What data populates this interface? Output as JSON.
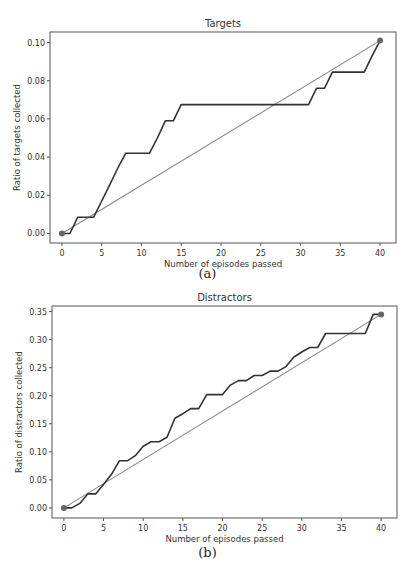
{
  "chart_data": [
    {
      "type": "line",
      "title": "Targets",
      "xlabel": "Number of episodes passed",
      "ylabel": "Ratio of targets collected",
      "caption": "(a)",
      "xlim": [
        -1.5,
        42
      ],
      "ylim": [
        -0.005,
        0.1055
      ],
      "xticks": [
        0,
        5,
        10,
        15,
        20,
        25,
        30,
        35,
        40
      ],
      "yticks": [
        0.0,
        0.02,
        0.04,
        0.06,
        0.08,
        0.1
      ],
      "ytick_labels": [
        "0.00",
        "0.02",
        "0.04",
        "0.06",
        "0.08",
        "0.10"
      ],
      "grid": false,
      "series": [
        {
          "name": "collected",
          "color": "#333333",
          "x": [
            0,
            1,
            2,
            3,
            4,
            5,
            6,
            7,
            8,
            9,
            10,
            11,
            12,
            13,
            14,
            15,
            16,
            17,
            18,
            19,
            20,
            21,
            22,
            23,
            24,
            25,
            26,
            27,
            28,
            29,
            30,
            31,
            32,
            33,
            34,
            35,
            36,
            37,
            38,
            39,
            40
          ],
          "values": [
            0,
            0,
            0.0085,
            0.0085,
            0.0085,
            0.017,
            0.0255,
            0.034,
            0.042,
            0.042,
            0.042,
            0.042,
            0.05,
            0.059,
            0.059,
            0.0675,
            0.0675,
            0.0675,
            0.0675,
            0.0675,
            0.0675,
            0.0675,
            0.0675,
            0.0675,
            0.0675,
            0.0675,
            0.0675,
            0.0675,
            0.0675,
            0.0675,
            0.0675,
            0.0675,
            0.076,
            0.076,
            0.0845,
            0.0845,
            0.0845,
            0.0845,
            0.0845,
            0.093,
            0.101
          ]
        },
        {
          "name": "linear reference",
          "color": "#888888",
          "x": [
            0,
            40
          ],
          "values": [
            0,
            0.101
          ]
        }
      ],
      "markers": [
        {
          "x": 0,
          "y": 0
        },
        {
          "x": 40,
          "y": 0.101
        }
      ]
    },
    {
      "type": "line",
      "title": "Distractors",
      "xlabel": "Number of episodes passed",
      "ylabel": "Ratio of distractors collected",
      "caption": "(b)",
      "xlim": [
        -1.5,
        42
      ],
      "ylim": [
        -0.018,
        0.36
      ],
      "xticks": [
        0,
        5,
        10,
        15,
        20,
        25,
        30,
        35,
        40
      ],
      "yticks": [
        0.0,
        0.05,
        0.1,
        0.15,
        0.2,
        0.25,
        0.3,
        0.35
      ],
      "ytick_labels": [
        "0.00",
        "0.05",
        "0.10",
        "0.15",
        "0.20",
        "0.25",
        "0.30",
        "0.35"
      ],
      "grid": false,
      "series": [
        {
          "name": "collected",
          "color": "#333333",
          "x": [
            0,
            1,
            2,
            3,
            4,
            5,
            6,
            7,
            8,
            9,
            10,
            11,
            12,
            13,
            14,
            15,
            16,
            17,
            18,
            19,
            20,
            21,
            22,
            23,
            24,
            25,
            26,
            27,
            28,
            29,
            30,
            31,
            32,
            33,
            34,
            35,
            36,
            37,
            38,
            39,
            40
          ],
          "values": [
            0,
            0,
            0.008,
            0.025,
            0.025,
            0.042,
            0.06,
            0.084,
            0.084,
            0.093,
            0.11,
            0.118,
            0.118,
            0.126,
            0.16,
            0.168,
            0.177,
            0.177,
            0.202,
            0.202,
            0.202,
            0.219,
            0.227,
            0.227,
            0.236,
            0.236,
            0.244,
            0.244,
            0.252,
            0.269,
            0.278,
            0.286,
            0.286,
            0.311,
            0.311,
            0.311,
            0.311,
            0.311,
            0.311,
            0.345,
            0.345
          ]
        },
        {
          "name": "linear reference",
          "color": "#888888",
          "x": [
            0,
            40
          ],
          "values": [
            0,
            0.345
          ]
        }
      ],
      "markers": [
        {
          "x": 0,
          "y": 0
        },
        {
          "x": 40,
          "y": 0.345
        }
      ]
    }
  ]
}
